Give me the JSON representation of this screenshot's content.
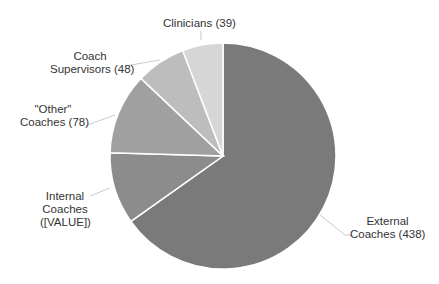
{
  "chart_data": {
    "type": "pie",
    "title": "",
    "slices": [
      {
        "label": "External Coaches",
        "display": "External Coaches (438)",
        "value": 438,
        "color": "#7a7a7a"
      },
      {
        "label": "Internal Coaches",
        "display": "Internal Coaches ([VALUE])",
        "value": 69,
        "value_text": "[VALUE]",
        "color": "#8c8c8c"
      },
      {
        "label": "\"Other\" Coaches",
        "display": "\"Other\" Coaches (78)",
        "value": 78,
        "color": "#a0a0a0"
      },
      {
        "label": "Coach Supervisors",
        "display": "Coach Supervisors (48)",
        "value": 48,
        "color": "#bdbdbd"
      },
      {
        "label": "Clinicians",
        "display": "Clinicians (39)",
        "value": 39,
        "color": "#d6d6d6"
      }
    ],
    "start_angle": "12 o'clock, clockwise",
    "legend": "none (leader-line labels)"
  },
  "labels": {
    "clinicians": "Clinicians (39)",
    "supervisors_1": "Coach",
    "supervisors_2": "Supervisors (48)",
    "other_1": "\"Other\"",
    "other_2": "Coaches (78)",
    "internal_1": "Internal",
    "internal_2": "Coaches",
    "internal_3": "([VALUE])",
    "external_1": "External",
    "external_2": "Coaches (438)"
  }
}
